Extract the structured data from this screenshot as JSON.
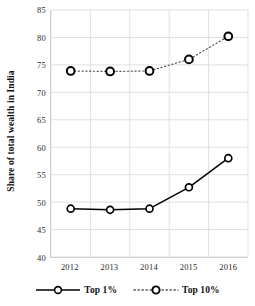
{
  "chart_data": {
    "type": "line",
    "title": "",
    "xlabel": "",
    "ylabel": "Share of total wealth in India",
    "categories": [
      "2012",
      "2013",
      "2014",
      "2015",
      "2016"
    ],
    "x": [
      2012,
      2013,
      2014,
      2015,
      2016
    ],
    "ylim": [
      40,
      85
    ],
    "yticks": [
      40,
      45,
      50,
      55,
      60,
      65,
      70,
      75,
      80,
      85
    ],
    "ytick_labels": [
      "40",
      "45",
      "50",
      "55",
      "60",
      "65",
      "70",
      "75",
      "80",
      "85"
    ],
    "grid": true,
    "legend_position": "bottom",
    "series": [
      {
        "name": "Top 1%",
        "values": [
          48.8,
          48.6,
          48.8,
          52.7,
          58.0
        ],
        "linestyle": "solid",
        "marker": "circle",
        "color": "#000000"
      },
      {
        "name": "Top 10%",
        "values": [
          73.9,
          73.8,
          73.9,
          76.0,
          80.2
        ],
        "linestyle": "dotted",
        "marker": "circle",
        "color": "#000000"
      }
    ]
  },
  "legend": {
    "items": [
      {
        "label": "Top 1%"
      },
      {
        "label": "Top 10%"
      }
    ]
  }
}
